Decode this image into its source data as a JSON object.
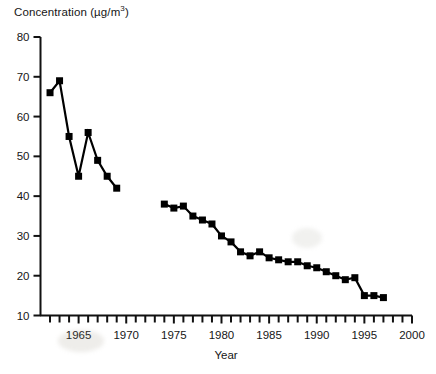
{
  "chart_data": {
    "type": "line",
    "title": "Concentration (µg/m3)",
    "title_main": "Concentration (µg/m",
    "title_sup": "3",
    "title_close": ")",
    "xlabel": "Year",
    "ylabel": "Concentration (µg/m3)",
    "xlim": [
      1961,
      2000
    ],
    "ylim": [
      10,
      80
    ],
    "grid": false,
    "legend": false,
    "marker": "filled-square",
    "line_color": "#000000",
    "marker_color": "#000000",
    "x_ticks_labeled": [
      "1965",
      "1970",
      "1975",
      "1980",
      "1985",
      "1990",
      "1995",
      "2000"
    ],
    "x_ticks_labeled_values": [
      1965,
      1970,
      1975,
      1980,
      1985,
      1990,
      1995,
      2000
    ],
    "x_tick_interval_minor": 1,
    "y_ticks": [
      "10",
      "20",
      "30",
      "40",
      "50",
      "60",
      "70",
      "80"
    ],
    "y_tick_values": [
      10,
      20,
      30,
      40,
      50,
      60,
      70,
      80
    ],
    "series": [
      {
        "name": "Early record",
        "x": [
          1962,
          1963,
          1964,
          1965,
          1966,
          1967,
          1968,
          1969
        ],
        "values": [
          66,
          69,
          55,
          45,
          56,
          49,
          45,
          42
        ]
      },
      {
        "name": "Later record",
        "x": [
          1974,
          1975,
          1976,
          1977,
          1978,
          1979,
          1980,
          1981,
          1982,
          1983,
          1984,
          1985,
          1986,
          1987,
          1988,
          1989,
          1990,
          1991,
          1992,
          1993,
          1994,
          1995,
          1996,
          1997
        ],
        "values": [
          38,
          37,
          37.5,
          35,
          34,
          33,
          30,
          28.5,
          26,
          25,
          26,
          24.5,
          24,
          23.5,
          23.5,
          22.5,
          22,
          21,
          20,
          19,
          19.5,
          15,
          15,
          14.5
        ]
      }
    ]
  },
  "axes": {
    "x_axis_label": "Year",
    "y_axis_label": "Concentration (µg/m3)"
  }
}
